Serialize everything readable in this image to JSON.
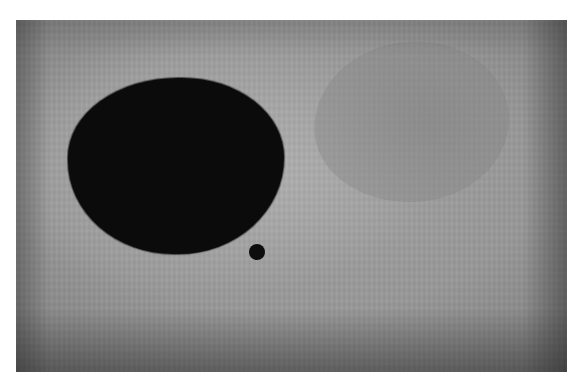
{
  "artwork": {
    "description": "Photograph of an abstract painting: a large dark ovoid shape, a small black dot, and a faint ghostly circle on a textured gray ground",
    "colors": {
      "ground": "#989898",
      "ground_edge": "#7c7c7c",
      "dark_shape": "#0b0b0b",
      "small_dot": "#0d0d0d",
      "ghost_circle": "#878787",
      "border": "#ffffff"
    },
    "shapes": [
      {
        "name": "dark-oval",
        "bbox": [
          68,
          78,
          284,
          254
        ]
      },
      {
        "name": "small-dot",
        "center": [
          257,
          252
        ],
        "radius": 8
      },
      {
        "name": "ghost-circle",
        "bbox": [
          315,
          43,
          508,
          200
        ]
      }
    ]
  }
}
